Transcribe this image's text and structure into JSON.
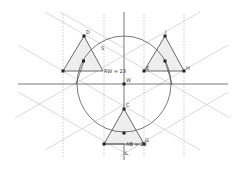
{
  "diagram": {
    "labels": {
      "point_D": "D",
      "point_I": "I",
      "point_H": "H",
      "point_C": "C",
      "point_W": "W",
      "point_G": "G",
      "point_E": "E",
      "point_S": "S",
      "point_L": "L",
      "measure_rw": "RW = 23",
      "measure_ab": "AB = 20"
    },
    "colors": {
      "axis": "#555555",
      "construction_line": "#c8c8c8",
      "dotted_line": "#aaaaaa",
      "triangle_fill": "#eeeeee",
      "triangle_stroke": "#444444",
      "point": "#222222"
    }
  }
}
